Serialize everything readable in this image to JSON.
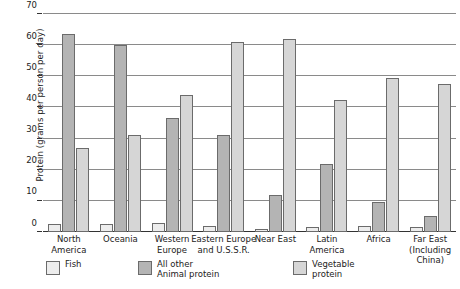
{
  "chart_data": {
    "type": "bar",
    "title": "",
    "xlabel": "",
    "ylabel": "Protein (grams per person per day)",
    "ylim": [
      0,
      70
    ],
    "yticks": [
      0,
      10,
      20,
      30,
      40,
      50,
      60,
      70
    ],
    "grid": true,
    "legend_position": "bottom",
    "categories": [
      "North America",
      "Oceania",
      "Western Europe",
      "Eastern Europe and U.S.S.R.",
      "Near East",
      "Latin America",
      "Africa",
      "Far East (Including China)"
    ],
    "category_label_lines": [
      [
        "North",
        "America"
      ],
      [
        "Oceania"
      ],
      [
        "Western",
        "Europe"
      ],
      [
        "Eastern Europe",
        "and U.S.S.R."
      ],
      [
        "Near East"
      ],
      [
        "Latin",
        "America"
      ],
      [
        "Africa"
      ],
      [
        "Far East",
        "(Including",
        "China)"
      ]
    ],
    "series": [
      {
        "name": "Fish",
        "color": "#ededed",
        "values": [
          2.5,
          2.5,
          3,
          2,
          1,
          1.5,
          2,
          1.5
        ]
      },
      {
        "name": "All other\nAnimal protein",
        "color": "#b4b4b4",
        "values": [
          63.5,
          60,
          36.5,
          31,
          12,
          22,
          9.5,
          5
        ]
      },
      {
        "name": "Vegetable\nprotein",
        "color": "#d6d6d6",
        "values": [
          27,
          31,
          44,
          61,
          62,
          42.5,
          49.5,
          47.5
        ]
      }
    ]
  },
  "legend": {
    "items": [
      {
        "label": "Fish",
        "swatch": "fish"
      },
      {
        "label": "All other\nAnimal protein",
        "swatch": "animal"
      },
      {
        "label": "Vegetable\nprotein",
        "swatch": "vegetable"
      }
    ]
  }
}
